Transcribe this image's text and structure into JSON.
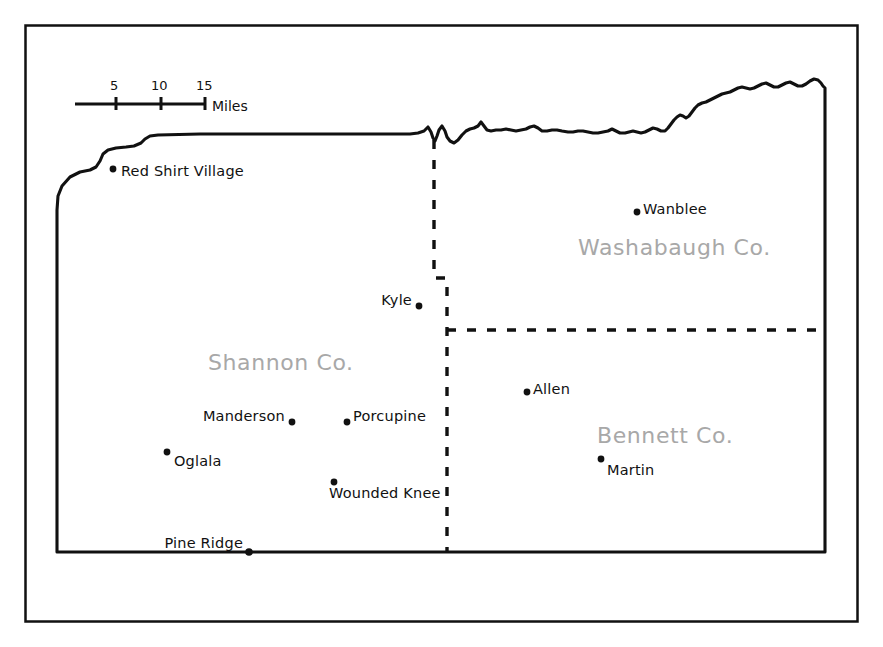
{
  "map": {
    "title": "Pine Ridge Indian Reservation county map",
    "background_color": "#ffffff",
    "border_color": "#111111",
    "county_label_color": "#a8a8a8",
    "place_label_color": "#111111",
    "frame": {
      "x": 25,
      "y": 25,
      "width": 833,
      "height": 597
    }
  },
  "scale_bar": {
    "unit_label": "Miles",
    "ticks": [
      {
        "value": "5",
        "x": 115
      },
      {
        "value": "10",
        "x": 160
      },
      {
        "value": "15",
        "x": 205
      }
    ],
    "bar": {
      "x1": 75,
      "x2": 205,
      "y": 104
    }
  },
  "counties": [
    {
      "name": "Shannon Co.",
      "label": "Shannon Co.",
      "x": 208,
      "y": 350
    },
    {
      "name": "Washabaugh Co.",
      "label": "Washabaugh Co.",
      "x": 578,
      "y": 235
    },
    {
      "name": "Bennett Co.",
      "label": "Bennett Co.",
      "x": 597,
      "y": 423
    }
  ],
  "places": [
    {
      "name": "Red Shirt Village",
      "label": "Red Shirt Village",
      "dot_x": 113,
      "dot_y": 169,
      "label_x": 121,
      "label_y": 163,
      "anchor": "left"
    },
    {
      "name": "Wanblee",
      "label": "Wanblee",
      "dot_x": 637,
      "dot_y": 212,
      "label_x": 643,
      "label_y": 201,
      "anchor": "left"
    },
    {
      "name": "Kyle",
      "label": "Kyle",
      "dot_x": 419,
      "dot_y": 306,
      "label_x": 412,
      "label_y": 292,
      "anchor": "right"
    },
    {
      "name": "Allen",
      "label": "Allen",
      "dot_x": 527,
      "dot_y": 392,
      "label_x": 533,
      "label_y": 381,
      "anchor": "left"
    },
    {
      "name": "Manderson",
      "label": "Manderson",
      "dot_x": 292,
      "dot_y": 422,
      "label_x": 285,
      "label_y": 408,
      "anchor": "right"
    },
    {
      "name": "Porcupine",
      "label": "Porcupine",
      "dot_x": 347,
      "dot_y": 422,
      "label_x": 353,
      "label_y": 408,
      "anchor": "left"
    },
    {
      "name": "Martin",
      "label": "Martin",
      "dot_x": 601,
      "dot_y": 459,
      "label_x": 607,
      "label_y": 462,
      "anchor": "left"
    },
    {
      "name": "Oglala",
      "label": "Oglala",
      "dot_x": 167,
      "dot_y": 452,
      "label_x": 174,
      "label_y": 453,
      "anchor": "left"
    },
    {
      "name": "Wounded Knee",
      "label": "Wounded Knee",
      "dot_x": 334,
      "dot_y": 482,
      "label_x": 329,
      "label_y": 485,
      "anchor": "left"
    },
    {
      "name": "Pine Ridge",
      "label": "Pine Ridge",
      "dot_x": 249,
      "dot_y": 552,
      "label_x": 243,
      "label_y": 535,
      "anchor": "right"
    }
  ],
  "county_boundaries": {
    "vertical_dashed": {
      "x_top": 434,
      "x_bottom": 447,
      "y_top": 140,
      "y_jog": 278,
      "y_bottom": 552
    },
    "horizontal_dashed": {
      "x_left": 447,
      "x_right": 825,
      "y": 330
    }
  },
  "reservation_outline": {
    "south_y": 552,
    "east_x": 825,
    "west_x": 57,
    "description": "Irregular river boundary on north, stepped boundary on northwest"
  }
}
